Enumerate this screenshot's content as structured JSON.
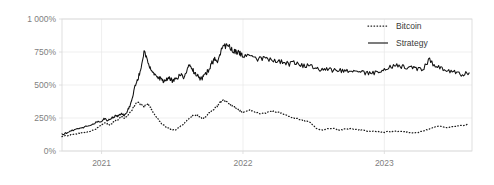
{
  "chart_data": {
    "type": "line",
    "title": "",
    "xlabel": "",
    "ylabel": "",
    "grid": true,
    "legend_position": "top-right",
    "ylim": [
      0,
      1000
    ],
    "y_unit": "%",
    "yticks": [
      0,
      250,
      500,
      750,
      1000
    ],
    "ytick_labels": [
      "0%",
      "250%",
      "500%",
      "750%",
      "1 000%"
    ],
    "xlim": [
      2020.72,
      2023.62
    ],
    "xticks": [
      2021,
      2022,
      2023
    ],
    "xtick_labels": [
      "2021",
      "2022",
      "2023"
    ],
    "series": [
      {
        "name": "Bitcoin",
        "style": "dotted",
        "color": "#1a1a1a",
        "x": [
          2020.72,
          2020.76,
          2020.8,
          2020.84,
          2020.88,
          2020.92,
          2020.96,
          2021.0,
          2021.02,
          2021.04,
          2021.06,
          2021.08,
          2021.1,
          2021.12,
          2021.14,
          2021.16,
          2021.18,
          2021.2,
          2021.22,
          2021.24,
          2021.26,
          2021.28,
          2021.3,
          2021.32,
          2021.34,
          2021.36,
          2021.38,
          2021.4,
          2021.42,
          2021.44,
          2021.46,
          2021.48,
          2021.5,
          2021.52,
          2021.54,
          2021.56,
          2021.58,
          2021.6,
          2021.62,
          2021.64,
          2021.66,
          2021.68,
          2021.7,
          2021.72,
          2021.74,
          2021.76,
          2021.78,
          2021.8,
          2021.82,
          2021.84,
          2021.86,
          2021.88,
          2021.9,
          2021.92,
          2021.94,
          2021.96,
          2021.98,
          2022.0,
          2022.04,
          2022.08,
          2022.12,
          2022.16,
          2022.2,
          2022.24,
          2022.28,
          2022.32,
          2022.36,
          2022.4,
          2022.44,
          2022.48,
          2022.52,
          2022.56,
          2022.6,
          2022.64,
          2022.68,
          2022.72,
          2022.76,
          2022.8,
          2022.84,
          2022.88,
          2022.92,
          2022.96,
          2023.0,
          2023.04,
          2023.08,
          2023.12,
          2023.16,
          2023.2,
          2023.24,
          2023.28,
          2023.32,
          2023.36,
          2023.4,
          2023.44,
          2023.48,
          2023.52,
          2023.56,
          2023.6
        ],
        "y": [
          112,
          118,
          126,
          132,
          140,
          150,
          168,
          200,
          215,
          205,
          198,
          215,
          232,
          240,
          262,
          248,
          262,
          290,
          320,
          355,
          372,
          352,
          330,
          360,
          345,
          300,
          268,
          240,
          212,
          195,
          180,
          170,
          162,
          158,
          172,
          190,
          205,
          225,
          248,
          262,
          275,
          268,
          255,
          248,
          262,
          288,
          305,
          322,
          340,
          368,
          390,
          375,
          355,
          345,
          330,
          318,
          300,
          292,
          310,
          300,
          282,
          288,
          300,
          295,
          282,
          268,
          250,
          240,
          228,
          215,
          168,
          158,
          168,
          172,
          160,
          165,
          168,
          162,
          160,
          150,
          148,
          145,
          142,
          148,
          150,
          148,
          142,
          138,
          140,
          152,
          168,
          182,
          188,
          178,
          182,
          190,
          195,
          200
        ]
      },
      {
        "name": "Strategy",
        "style": "solid",
        "color": "#111111",
        "x": [
          2020.72,
          2020.76,
          2020.8,
          2020.84,
          2020.88,
          2020.92,
          2020.96,
          2021.0,
          2021.02,
          2021.04,
          2021.06,
          2021.08,
          2021.1,
          2021.12,
          2021.14,
          2021.16,
          2021.18,
          2021.2,
          2021.22,
          2021.24,
          2021.26,
          2021.28,
          2021.3,
          2021.32,
          2021.34,
          2021.36,
          2021.38,
          2021.4,
          2021.42,
          2021.44,
          2021.46,
          2021.48,
          2021.5,
          2021.52,
          2021.54,
          2021.56,
          2021.58,
          2021.6,
          2021.62,
          2021.64,
          2021.66,
          2021.68,
          2021.7,
          2021.72,
          2021.74,
          2021.76,
          2021.78,
          2021.8,
          2021.82,
          2021.84,
          2021.86,
          2021.88,
          2021.9,
          2021.92,
          2021.94,
          2021.96,
          2021.98,
          2022.0,
          2022.04,
          2022.08,
          2022.12,
          2022.16,
          2022.2,
          2022.24,
          2022.28,
          2022.32,
          2022.36,
          2022.4,
          2022.44,
          2022.48,
          2022.52,
          2022.56,
          2022.6,
          2022.64,
          2022.68,
          2022.72,
          2022.76,
          2022.8,
          2022.84,
          2022.88,
          2022.92,
          2022.96,
          2023.0,
          2023.04,
          2023.08,
          2023.12,
          2023.16,
          2023.2,
          2023.24,
          2023.28,
          2023.32,
          2023.36,
          2023.4,
          2023.44,
          2023.48,
          2023.52,
          2023.56,
          2023.6
        ],
        "y": [
          125,
          140,
          158,
          168,
          182,
          195,
          215,
          228,
          245,
          232,
          240,
          255,
          270,
          262,
          285,
          272,
          300,
          340,
          420,
          500,
          560,
          620,
          745,
          700,
          640,
          600,
          575,
          560,
          545,
          530,
          545,
          560,
          530,
          545,
          560,
          575,
          560,
          600,
          650,
          620,
          590,
          570,
          545,
          560,
          590,
          620,
          665,
          700,
          680,
          745,
          820,
          790,
          800,
          770,
          760,
          745,
          740,
          730,
          720,
          700,
          700,
          715,
          690,
          680,
          670,
          660,
          665,
          650,
          645,
          640,
          625,
          620,
          618,
          612,
          608,
          605,
          600,
          598,
          595,
          592,
          590,
          600,
          615,
          635,
          650,
          640,
          630,
          625,
          620,
          625,
          700,
          640,
          625,
          612,
          600,
          585,
          580,
          592
        ]
      }
    ]
  },
  "legend": {
    "items": [
      {
        "label": "Bitcoin",
        "style": "dotted"
      },
      {
        "label": "Strategy",
        "style": "solid"
      }
    ]
  }
}
